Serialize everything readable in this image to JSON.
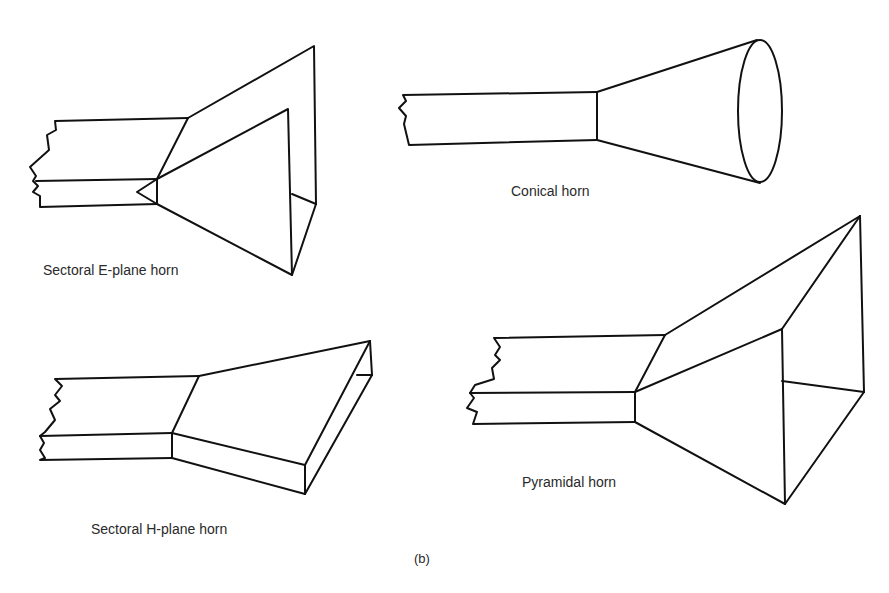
{
  "figure": {
    "panel_label": "(b)",
    "horns": [
      {
        "id": "e-plane",
        "label": "Sectoral E-plane horn"
      },
      {
        "id": "conical",
        "label": "Conical horn"
      },
      {
        "id": "h-plane",
        "label": "Sectoral H-plane horn"
      },
      {
        "id": "pyramidal",
        "label": "Pyramidal horn"
      }
    ]
  }
}
